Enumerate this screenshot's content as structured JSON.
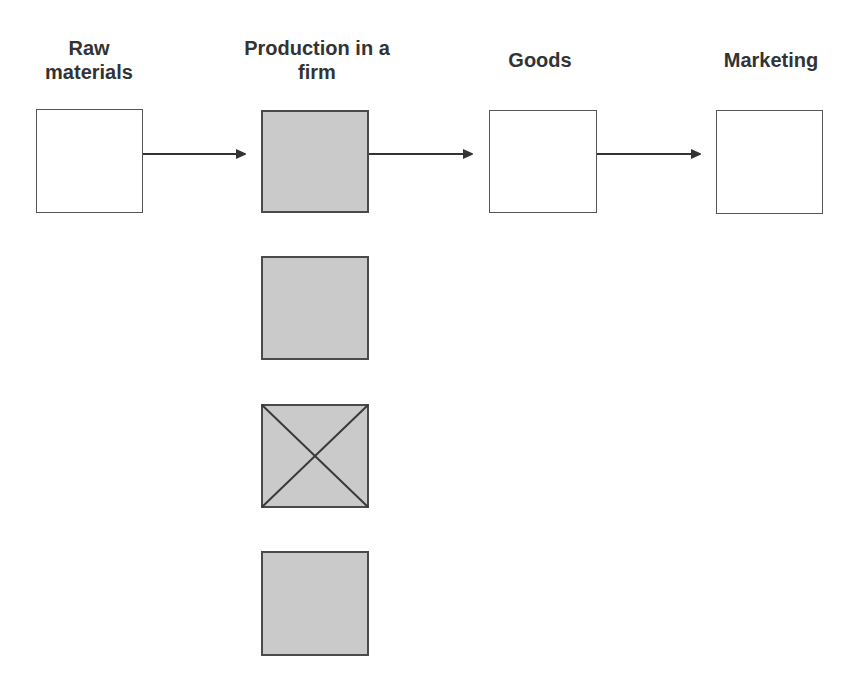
{
  "diagram": {
    "columns": [
      {
        "label": "Raw materials",
        "label_lines": "Raw\nmaterials",
        "fill": "white"
      },
      {
        "label": "Production in a firm",
        "label_lines": "Production in a\nfirm",
        "fill": "gray"
      },
      {
        "label": "Goods",
        "label_lines": "Goods",
        "fill": "white"
      },
      {
        "label": "Marketing",
        "label_lines": "Marketing",
        "fill": "white"
      }
    ],
    "arrows": [
      {
        "from": "Raw materials",
        "to": "Production in a firm"
      },
      {
        "from": "Production in a firm",
        "to": "Goods"
      },
      {
        "from": "Goods",
        "to": "Marketing"
      }
    ],
    "production_stack": [
      {
        "index": 1,
        "fill": "gray",
        "crossed": false
      },
      {
        "index": 2,
        "fill": "gray",
        "crossed": false
      },
      {
        "index": 3,
        "fill": "gray",
        "crossed": true
      },
      {
        "index": 4,
        "fill": "gray",
        "crossed": false
      }
    ],
    "colors": {
      "stroke": "#555555",
      "gray_fill": "#cacaca",
      "text": "#333333",
      "arrow": "#333333"
    }
  }
}
